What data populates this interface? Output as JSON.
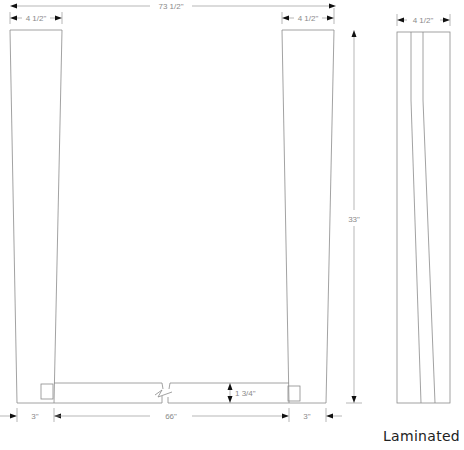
{
  "drawing": {
    "title": "Laminated",
    "front_view": {
      "overall_width": "73 1/2\"",
      "left_leg_top_width": "4 1/2\"",
      "right_leg_top_width": "4 1/2\"",
      "height": "33\"",
      "left_leg_bottom_width": "3\"",
      "stretcher_length": "66\"",
      "right_leg_bottom_width": "3\"",
      "stretcher_thickness": "1 3/4\""
    },
    "side_view": {
      "width": "4 1/2\"",
      "laminations": 3
    }
  },
  "colors": {
    "line": "#8a8a8a",
    "arrow": "#111111",
    "text": "#8a8a8a"
  }
}
